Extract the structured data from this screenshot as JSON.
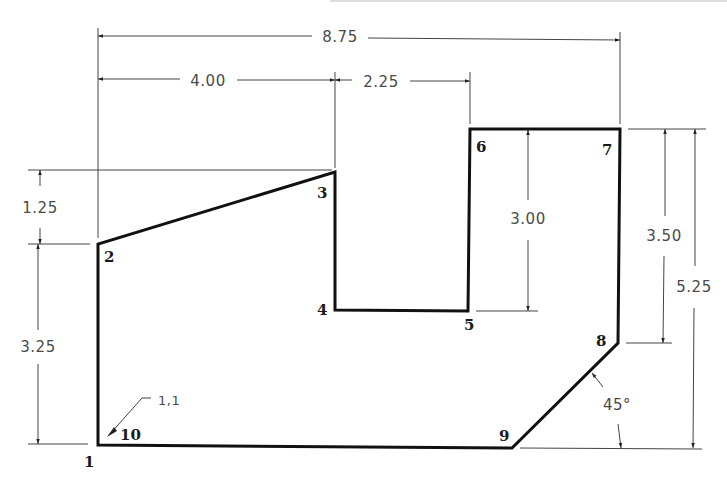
{
  "drawing": {
    "title": "Dimensioned polygon outline",
    "points": [
      {
        "id": "1",
        "label": "1",
        "x": 0,
        "y": 0
      },
      {
        "id": "2",
        "label": "2"
      },
      {
        "id": "3",
        "label": "3"
      },
      {
        "id": "4",
        "label": "4"
      },
      {
        "id": "5",
        "label": "5"
      },
      {
        "id": "6",
        "label": "6"
      },
      {
        "id": "7",
        "label": "7"
      },
      {
        "id": "8",
        "label": "8"
      },
      {
        "id": "9",
        "label": "9"
      },
      {
        "id": "10",
        "label": "10"
      }
    ],
    "dimensions": {
      "overall_width": "8.75",
      "width_to_3": "4.00",
      "width_3_to_6": "2.25",
      "rise_2_to_3": "1.25",
      "height_1_to_2": "3.25",
      "notch_depth": "3.00",
      "height_8_to_7": "3.50",
      "overall_height": "5.25",
      "chamfer_angle": "45°"
    },
    "annotations": {
      "start_coord": "1,1"
    }
  }
}
